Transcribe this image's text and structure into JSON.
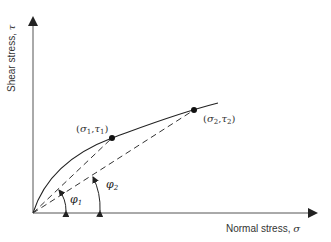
{
  "diagram": {
    "type": "failure-envelope",
    "axes": {
      "x_label": "Normal stress, ",
      "x_symbol": "σ",
      "y_label": "Shear stress, ",
      "y_symbol": "τ"
    },
    "points": [
      {
        "id": "p1",
        "sigma": "σ",
        "tau": "τ",
        "index": "1",
        "label_open": "(",
        "label_sep": ",",
        "label_close": ")"
      },
      {
        "id": "p2",
        "sigma": "σ",
        "tau": "τ",
        "index": "2",
        "label_open": "(",
        "label_sep": ",",
        "label_close": ")"
      }
    ],
    "angles": [
      {
        "symbol": "φ",
        "index": "1"
      },
      {
        "symbol": "φ",
        "index": "2"
      }
    ],
    "curve": "curved failure envelope (solid)",
    "secants": "dashed lines from origin to each point"
  },
  "colors": {
    "line": "#222222",
    "text": "#333333",
    "background": "#ffffff"
  }
}
